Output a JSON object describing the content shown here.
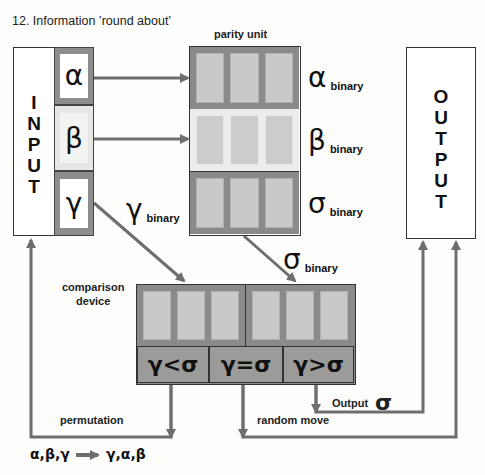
{
  "title": "12.  Information ’round about’",
  "input": {
    "label_letters": [
      "I",
      "N",
      "P",
      "U",
      "T"
    ],
    "cells": [
      {
        "symbol": "α"
      },
      {
        "symbol": "β"
      },
      {
        "symbol": "γ"
      }
    ]
  },
  "parity_unit": {
    "label": "parity unit",
    "rows": [
      {
        "symbol": "α",
        "sub": "binary"
      },
      {
        "symbol": "β",
        "sub": "binary"
      },
      {
        "symbol": "σ",
        "sub": "binary"
      }
    ]
  },
  "output": {
    "label_letters": [
      "O",
      "U",
      "T",
      "P",
      "U",
      "T"
    ]
  },
  "arrows": {
    "gamma_binary": {
      "symbol": "γ",
      "sub": "binary"
    },
    "sigma_binary": {
      "symbol": "σ",
      "sub": "binary"
    }
  },
  "comparison_device": {
    "label_line1": "comparison",
    "label_line2": "device",
    "results": [
      "γ<σ",
      "γ=σ",
      "γ>σ"
    ]
  },
  "paths": {
    "permutation": "permutation",
    "random_move": "random move",
    "output_label": "Output",
    "output_symbol": "σ"
  },
  "permutation_rule": {
    "from": "α,β,γ",
    "to": "γ,α,β"
  },
  "colors": {
    "line": "#6e6e6e",
    "dark_fill": "#8a8a8a",
    "light_fill": "#ededeb",
    "slot": "#c9c9c7"
  }
}
